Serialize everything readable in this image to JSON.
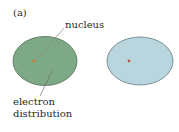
{
  "panel_label": "(a)",
  "labels": {
    "nucleus": "nucleus",
    "electron_line1": "electron",
    "electron_line2": "distribution"
  },
  "atoms": [
    {
      "name": "left-atom",
      "fill": "#7ea986",
      "stroke": "#4f6f57",
      "nucleus_color": "#d07a3a"
    },
    {
      "name": "right-atom",
      "fill": "#b9d6de",
      "stroke": "#5f7a82",
      "nucleus_color": "#b5604a"
    }
  ],
  "colors": {
    "leader_line": "#7a7a7a",
    "text": "#2a2a2a"
  }
}
